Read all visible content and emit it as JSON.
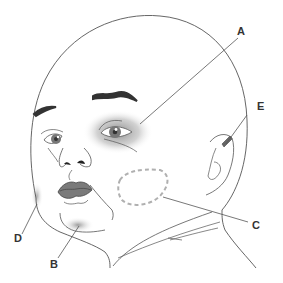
{
  "diagram": {
    "colors": {
      "outline": "#555555",
      "eyebrow": "#333333",
      "iris": "#777777",
      "lips": "#7a7a7a",
      "shading": "#8c8c8c",
      "dashed_region": "#b0b0b0",
      "label_text": "#333333"
    },
    "labels": [
      {
        "id": "A",
        "text": "A",
        "region": "periorbital shading around right eye"
      },
      {
        "id": "B",
        "text": "B",
        "region": "chin shading"
      },
      {
        "id": "C",
        "text": "C",
        "region": "dashed oval on cheek"
      },
      {
        "id": "D",
        "text": "D",
        "region": "left cheek edge shading"
      },
      {
        "id": "E",
        "text": "E",
        "region": "ear (upper helix) mark"
      }
    ]
  }
}
